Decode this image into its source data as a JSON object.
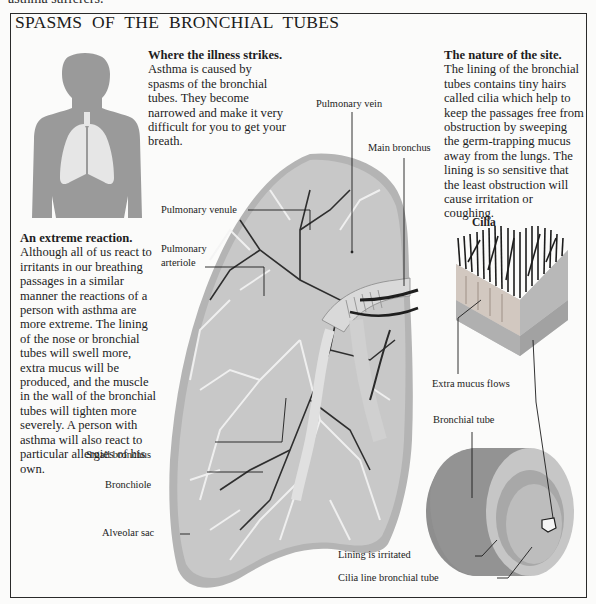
{
  "page": {
    "top_fragment": "asthma sufferers."
  },
  "title": "SPASMS OF THE BRONCHIAL TUBES",
  "sections": {
    "where": {
      "heading": "Where the illness strikes.",
      "lines": [
        "Asthma is caused by",
        "spasms of the bronchial",
        "tubes. They become",
        "narrowed and make it very",
        "difficult for you to get your",
        "breath."
      ]
    },
    "nature": {
      "heading": "The nature of the site.",
      "lines": [
        "The lining of the bronchial",
        "tubes contains tiny hairs",
        "called cilia which help to",
        "keep the passages free from",
        "obstruction by sweeping",
        "the germ-trapping mucus",
        "away from the lungs. The",
        "lining is so sensitive that",
        "the least obstruction will",
        "cause irritation or",
        "coughing."
      ]
    },
    "extreme": {
      "heading": "An extreme reaction.",
      "lines": [
        "Although all of us react to",
        "irritants in our breathing",
        "passages in a similar",
        "manner the reactions of a",
        "person with asthma are",
        "more extreme. The lining",
        "of the nose or bronchial",
        "tubes will swell more,",
        "extra mucus will be",
        "produced, and the muscle",
        "in the wall of the bronchial",
        "tubes will tighten more",
        "severely. A person with",
        "asthma will also react to",
        "particular allergies of his",
        "own."
      ]
    }
  },
  "labels": {
    "pulmonary_vein": "Pulmonary vein",
    "main_bronchus": "Main bronchus",
    "pulmonary_venule": "Pulmonary venule",
    "pulmonary_arteriole_1": "Pulmonary",
    "pulmonary_arteriole_2": "arteriole",
    "small_bronchus": "Small bronchus",
    "bronchiole": "Bronchiole",
    "alveolar_sac": "Alveolar sac",
    "cilia": "Cilia",
    "extra_mucus": "Extra mucus flows",
    "bronchial_tube": "Bronchial tube",
    "lining_irritated": "Lining is irritated",
    "cilia_line": "Cilia line bronchial tube"
  },
  "colors": {
    "silhouette": "#9a9a9a",
    "lungs_icon": "#e6e6e6",
    "lung_fill": "#b4b4b4",
    "tube_outer": "#8e8e8e",
    "frame": "#2a2a2a"
  }
}
